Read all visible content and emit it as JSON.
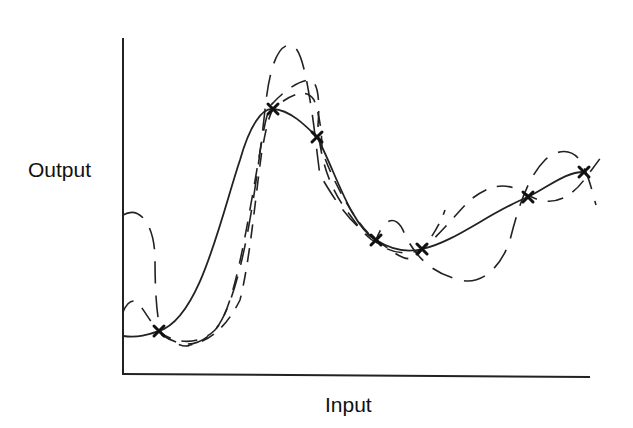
{
  "diagram": {
    "title": "",
    "y_axis_label": "Output",
    "x_axis_label": "Input",
    "colors": {
      "line": "#222222",
      "background": "#ffffff"
    },
    "observed_points_marker": "x-mark",
    "observed_points": [
      {
        "x": 159,
        "y": 331
      },
      {
        "x": 273,
        "y": 109
      },
      {
        "x": 317,
        "y": 137
      },
      {
        "x": 376,
        "y": 240
      },
      {
        "x": 422,
        "y": 249
      },
      {
        "x": 528,
        "y": 197
      },
      {
        "x": 584,
        "y": 172
      }
    ],
    "curves": [
      {
        "name": "solid-fit",
        "style": "solid"
      },
      {
        "name": "dashed-sample-1",
        "style": "long-dash"
      },
      {
        "name": "dashed-sample-2",
        "style": "dash"
      },
      {
        "name": "dashed-sample-3",
        "style": "dash"
      }
    ]
  }
}
